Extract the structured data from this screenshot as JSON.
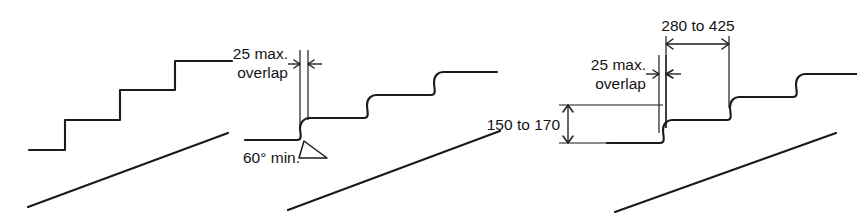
{
  "figure": {
    "background_color": "#ffffff",
    "line_color": "#1b1b1b",
    "width": 857,
    "height": 221
  },
  "panels": [
    {
      "id": "panel-left",
      "name": "square-nosing-stair-profile",
      "description": "Stair profile with square edged steps and pitch line",
      "labels": []
    },
    {
      "id": "panel-middle",
      "name": "overlap-and-riser-angle-profile",
      "description": "Stair profile with sloped riser showing overlap and riser angle limits",
      "labels": [
        {
          "name": "overlap-label",
          "line1": "25 max.",
          "line2": "overlap"
        },
        {
          "name": "riser-angle-label",
          "line1": "60° min."
        }
      ]
    },
    {
      "id": "panel-right",
      "name": "tread-and-riser-dimension-profile",
      "description": "Stair profile annotated with going, rise and overlap dimensions",
      "labels": [
        {
          "name": "going-dimension-label",
          "line1": "280 to 425"
        },
        {
          "name": "overlap-label",
          "line1": "25 max.",
          "line2": "overlap"
        },
        {
          "name": "rise-dimension-label",
          "line1": "150 to 170"
        }
      ]
    }
  ],
  "dimensions": {
    "overlap_max": "25 max.",
    "overlap_word": "overlap",
    "riser_angle_min": "60° min.",
    "going_range": "280 to 425",
    "rise_range": "150 to 170"
  }
}
